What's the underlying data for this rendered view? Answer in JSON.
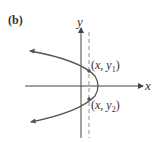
{
  "diagram": {
    "panel_label": "(b)",
    "x_axis_label": "x",
    "y_axis_label": "y",
    "point1": {
      "x": "x",
      "y": "y",
      "sub": "1"
    },
    "point2": {
      "x": "x",
      "y": "y",
      "sub": "2"
    },
    "colors": {
      "curve": "#555555",
      "axis": "#444444",
      "dashed": "#888888"
    }
  }
}
